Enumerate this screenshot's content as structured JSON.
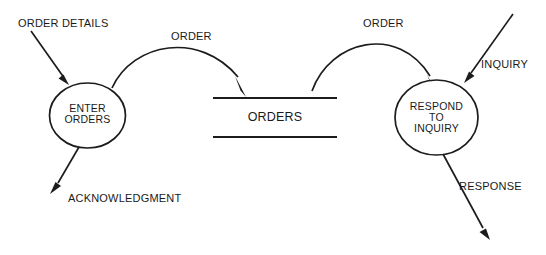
{
  "diagram": {
    "type": "data-flow-diagram",
    "background_color": "#ffffff",
    "stroke_color": "#1c1c1c",
    "text_color": "#1a1a1a",
    "processes": [
      {
        "id": "enter-orders",
        "lines": [
          "ENTER",
          "ORDERS"
        ],
        "line1": "ENTER",
        "line2": "ORDERS"
      },
      {
        "id": "respond-to-inquiry",
        "lines": [
          "RESPOND",
          "TO",
          "INQUIRY"
        ],
        "line1": "RESPOND",
        "line2": "TO",
        "line3": "INQUIRY"
      }
    ],
    "data_stores": [
      {
        "id": "orders-store",
        "label": "ORDERS"
      }
    ],
    "flows": [
      {
        "id": "order-details",
        "label": "ORDER DETAILS",
        "from": "external",
        "to": "enter-orders"
      },
      {
        "id": "order-to-store",
        "label": "ORDER",
        "from": "enter-orders",
        "to": "orders-store"
      },
      {
        "id": "order-from-store",
        "label": "ORDER",
        "from": "orders-store",
        "to": "respond-to-inquiry"
      },
      {
        "id": "inquiry",
        "label": "INQUIRY",
        "from": "external",
        "to": "respond-to-inquiry"
      },
      {
        "id": "acknowledgment",
        "label": "ACKNOWLEDGMENT",
        "from": "enter-orders",
        "to": "external"
      },
      {
        "id": "response",
        "label": "RESPONSE",
        "from": "respond-to-inquiry",
        "to": "external"
      }
    ]
  }
}
